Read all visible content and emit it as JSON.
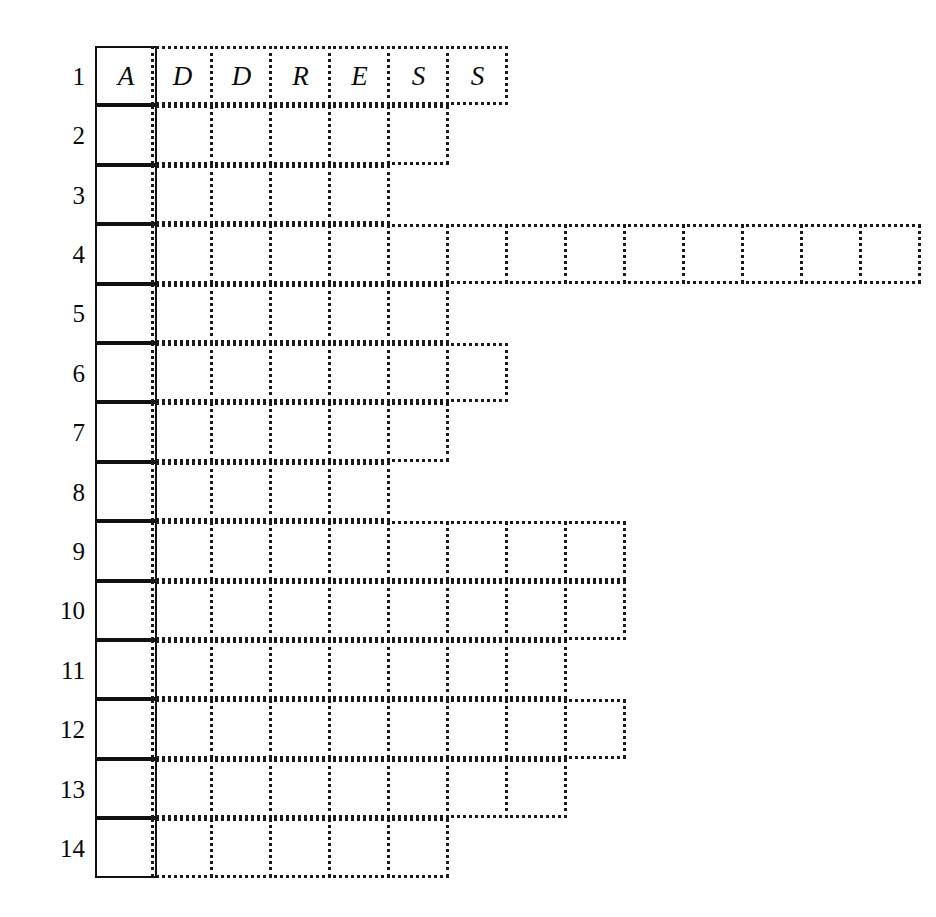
{
  "puzzle": {
    "title_word": "ADDRESS",
    "origin_x": 95,
    "origin_y": 46,
    "cell_width": 62,
    "cell_height": 59.4,
    "solid_column_label": "column-1-solid",
    "row_numbers": [
      "1",
      "2",
      "3",
      "4",
      "5",
      "6",
      "7",
      "8",
      "9",
      "10",
      "11",
      "12",
      "13",
      "14"
    ],
    "colors": {
      "ink": "#0a0a0a",
      "grid_dotted": "#1a1a1a",
      "grid_solid": "#111111",
      "background": "#ffffff"
    },
    "rows": [
      {
        "number": "1",
        "dotted_cells": 6,
        "letters": [
          "A",
          "D",
          "D",
          "R",
          "E",
          "S",
          "S"
        ]
      },
      {
        "number": "2",
        "dotted_cells": 5,
        "letters": [
          "",
          "",
          "",
          "",
          "",
          ""
        ]
      },
      {
        "number": "3",
        "dotted_cells": 4,
        "letters": [
          "",
          "",
          "",
          "",
          ""
        ]
      },
      {
        "number": "4",
        "dotted_cells": 13,
        "letters": [
          "",
          "",
          "",
          "",
          "",
          "",
          "",
          "",
          "",
          "",
          "",
          "",
          "",
          ""
        ]
      },
      {
        "number": "5",
        "dotted_cells": 5,
        "letters": [
          "",
          "",
          "",
          "",
          "",
          ""
        ]
      },
      {
        "number": "6",
        "dotted_cells": 6,
        "letters": [
          "",
          "",
          "",
          "",
          "",
          "",
          ""
        ]
      },
      {
        "number": "7",
        "dotted_cells": 5,
        "letters": [
          "",
          "",
          "",
          "",
          "",
          ""
        ]
      },
      {
        "number": "8",
        "dotted_cells": 4,
        "letters": [
          "",
          "",
          "",
          "",
          ""
        ]
      },
      {
        "number": "9",
        "dotted_cells": 8,
        "letters": [
          "",
          "",
          "",
          "",
          "",
          "",
          "",
          "",
          ""
        ]
      },
      {
        "number": "10",
        "dotted_cells": 8,
        "letters": [
          "",
          "",
          "",
          "",
          "",
          "",
          "",
          "",
          ""
        ]
      },
      {
        "number": "11",
        "dotted_cells": 7,
        "letters": [
          "",
          "",
          "",
          "",
          "",
          "",
          "",
          ""
        ]
      },
      {
        "number": "12",
        "dotted_cells": 8,
        "letters": [
          "",
          "",
          "",
          "",
          "",
          "",
          "",
          "",
          ""
        ]
      },
      {
        "number": "13",
        "dotted_cells": 7,
        "letters": [
          "",
          "",
          "",
          "",
          "",
          "",
          "",
          ""
        ]
      },
      {
        "number": "14",
        "dotted_cells": 5,
        "letters": [
          "",
          "",
          "",
          "",
          "",
          ""
        ]
      }
    ]
  }
}
